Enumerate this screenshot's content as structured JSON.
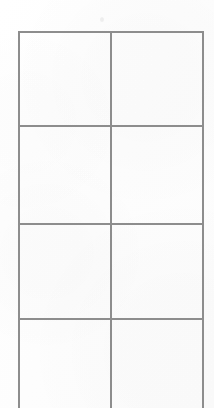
{
  "document": {
    "kind": "scanned-blank-table",
    "page_background_color": "#fdfdfd",
    "rule_color": "#8d8d8d",
    "rule_thickness_px": 1.6
  },
  "table": {
    "name": "blank-ruled-table",
    "bounds": {
      "left": 18,
      "top": 31,
      "right": 203,
      "bottom_visible": 408
    },
    "column_count": 2,
    "visible_row_count": 4,
    "bottom_edge_cropped": true,
    "column_x_positions": [
      18,
      110,
      203
    ],
    "row_y_positions": [
      31,
      125,
      223,
      318,
      408
    ],
    "columns": [
      {
        "index": 0,
        "header": "",
        "x": 18,
        "width": 92
      },
      {
        "index": 1,
        "header": "",
        "x": 110,
        "width": 93
      }
    ],
    "rows": [
      {
        "index": 0,
        "y": 31,
        "height": 94,
        "cropped": false,
        "cells": [
          "",
          ""
        ]
      },
      {
        "index": 1,
        "y": 125,
        "height": 98,
        "cropped": false,
        "cells": [
          "",
          ""
        ]
      },
      {
        "index": 2,
        "y": 223,
        "height": 95,
        "cropped": false,
        "cells": [
          "",
          ""
        ]
      },
      {
        "index": 3,
        "y": 318,
        "height": 90,
        "cropped": true,
        "cells": [
          "",
          ""
        ]
      }
    ],
    "horizontal_rules": [
      {
        "name": "top-border",
        "y": 31,
        "x1": 18,
        "x2": 203
      },
      {
        "name": "row-divider-1",
        "y": 125,
        "x1": 18,
        "x2": 203
      },
      {
        "name": "row-divider-2",
        "y": 223,
        "x1": 18,
        "x2": 203
      },
      {
        "name": "row-divider-3",
        "y": 318,
        "x1": 18,
        "x2": 203
      }
    ],
    "vertical_rules": [
      {
        "name": "left-border",
        "x": 18,
        "y1": 31,
        "y2": 408
      },
      {
        "name": "column-divider-1",
        "x": 110,
        "y1": 31,
        "y2": 408
      },
      {
        "name": "right-border",
        "x": 203,
        "y1": 31,
        "y2": 408
      }
    ]
  },
  "artifacts": [
    {
      "name": "scan-speck",
      "x": 100,
      "y": 17
    }
  ]
}
